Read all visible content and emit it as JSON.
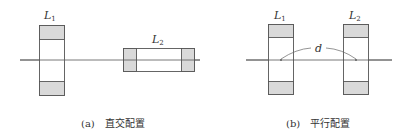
{
  "figure": {
    "panels": [
      {
        "id": "a",
        "caption": "(a)　直交配置",
        "coils": [
          {
            "name": "L",
            "subscript": "1",
            "orientation": "vertical"
          },
          {
            "name": "L",
            "subscript": "2",
            "orientation": "horizontal"
          }
        ]
      },
      {
        "id": "b",
        "caption": "(b)　平行配置",
        "coils": [
          {
            "name": "L",
            "subscript": "1",
            "orientation": "vertical"
          },
          {
            "name": "L",
            "subscript": "2",
            "orientation": "vertical"
          }
        ],
        "distance_label": "d"
      }
    ],
    "colors": {
      "line": "#555555",
      "shade": "#d9d9d9",
      "text": "#333333"
    }
  }
}
